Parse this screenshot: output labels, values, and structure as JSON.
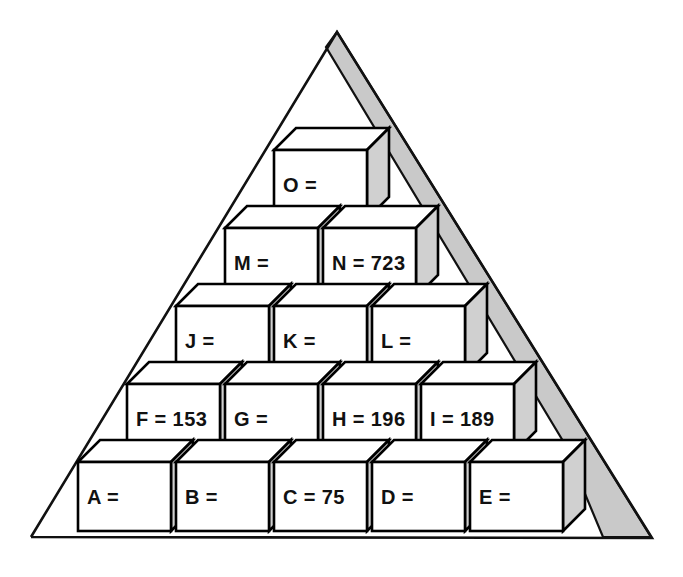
{
  "figure": {
    "background_color": "#ffffff",
    "outline_color": "#111111",
    "cube_front_color": "#ffffff",
    "cube_side_color": "#d0d0d0",
    "shadow_color": "#c9c9c9"
  },
  "triangle": {
    "apex": {
      "x": 337,
      "y": 32
    },
    "bottom_left": {
      "x": 31,
      "y": 537
    },
    "bottom_right": {
      "x": 652,
      "y": 538
    }
  },
  "shadow": {
    "points": "337,32 651,537 603,537 563,441 326,47"
  },
  "cube_geometry": {
    "width": 93,
    "height": 69,
    "depth_x": 22,
    "depth_y": 22
  },
  "rows": [
    {
      "row_index": 0,
      "row_name": "bottom-row",
      "y": 462,
      "cubes": [
        {
          "id": "A",
          "label": "A =",
          "letter": "A",
          "value": "",
          "x": 78
        },
        {
          "id": "B",
          "label": "B =",
          "letter": "B",
          "value": "",
          "x": 176
        },
        {
          "id": "C",
          "label": "C = 75",
          "letter": "C",
          "value": "75",
          "x": 274
        },
        {
          "id": "D",
          "label": "D =",
          "letter": "D",
          "value": "",
          "x": 372
        },
        {
          "id": "E",
          "label": "E =",
          "letter": "E",
          "value": "",
          "x": 470
        }
      ]
    },
    {
      "row_index": 1,
      "row_name": "row-f-i",
      "y": 384,
      "cubes": [
        {
          "id": "F",
          "label": "F = 153",
          "letter": "F",
          "value": "153",
          "x": 127
        },
        {
          "id": "G",
          "label": "G =",
          "letter": "G",
          "value": "",
          "x": 225
        },
        {
          "id": "H",
          "label": "H = 196",
          "letter": "H",
          "value": "196",
          "x": 323
        },
        {
          "id": "I",
          "label": "I = 189",
          "letter": "I",
          "value": "189",
          "x": 421
        }
      ]
    },
    {
      "row_index": 2,
      "row_name": "row-j-l",
      "y": 306,
      "cubes": [
        {
          "id": "J",
          "label": "J =",
          "letter": "J",
          "value": "",
          "x": 176
        },
        {
          "id": "K",
          "label": "K =",
          "letter": "K",
          "value": "",
          "x": 274
        },
        {
          "id": "L",
          "label": "L =",
          "letter": "L",
          "value": "",
          "x": 372
        }
      ]
    },
    {
      "row_index": 3,
      "row_name": "row-m-n",
      "y": 228,
      "cubes": [
        {
          "id": "M",
          "label": "M =",
          "letter": "M",
          "value": "",
          "x": 225
        },
        {
          "id": "N",
          "label": "N = 723",
          "letter": "N",
          "value": "723",
          "x": 323
        }
      ]
    },
    {
      "row_index": 4,
      "row_name": "top-row",
      "y": 150,
      "cubes": [
        {
          "id": "O",
          "label": "O =",
          "letter": "O",
          "value": "",
          "x": 274
        }
      ]
    }
  ],
  "chart_data": {
    "type": "diagram",
    "labels": [
      "A =",
      "B =",
      "C = 75",
      "D =",
      "E =",
      "F = 153",
      "G =",
      "H = 196",
      "I = 189",
      "J =",
      "K =",
      "L =",
      "M =",
      "N = 723",
      "O ="
    ],
    "known_values": {
      "C": 75,
      "F": 153,
      "H": 196,
      "I": 189,
      "N": 723
    },
    "unknown": [
      "A",
      "B",
      "D",
      "E",
      "G",
      "J",
      "K",
      "L",
      "M",
      "O"
    ],
    "tiers": [
      [
        "A",
        "B",
        "C",
        "D",
        "E"
      ],
      [
        "F",
        "G",
        "H",
        "I"
      ],
      [
        "J",
        "K",
        "L"
      ],
      [
        "M",
        "N"
      ],
      [
        "O"
      ]
    ]
  }
}
